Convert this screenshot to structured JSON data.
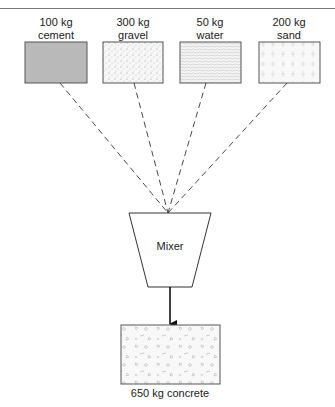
{
  "diagram": {
    "inputs": [
      {
        "id": "cement",
        "amount": "100 kg",
        "material": "cement",
        "fill": "#b8b8b8",
        "pattern": "solid-gray"
      },
      {
        "id": "gravel",
        "amount": "300 kg",
        "material": "gravel",
        "fill": "#f6f6f6",
        "pattern": "dots"
      },
      {
        "id": "water",
        "amount": "50 kg",
        "material": "water",
        "fill": "#f4f4f4",
        "pattern": "waves"
      },
      {
        "id": "sand",
        "amount": "200 kg",
        "material": "sand",
        "fill": "#f7f7f7",
        "pattern": "crosses"
      }
    ],
    "process": {
      "label": "Mixer"
    },
    "output": {
      "label": "650 kg concrete",
      "pattern": "aggregate"
    },
    "colors": {
      "line": "#333333",
      "border": "#555555",
      "background": "#ffffff"
    }
  }
}
